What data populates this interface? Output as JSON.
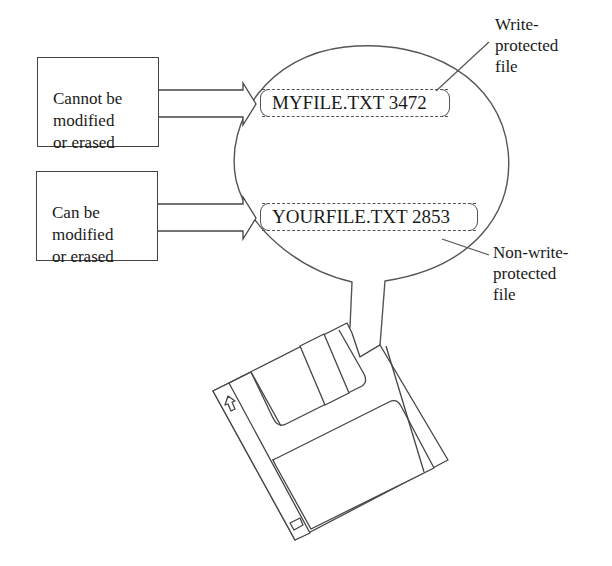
{
  "diagram": {
    "type": "floppy-disk-file-protection",
    "left_boxes": [
      {
        "id": "write-protected-box",
        "text": "Cannot be\nmodified\nor erased"
      },
      {
        "id": "non-write-protected-box",
        "text": "Can be\nmodified\nor erased"
      }
    ],
    "files": [
      {
        "name": "MYFILE.TXT",
        "size": "3472",
        "display": "MYFILE.TXT 3472",
        "protected": true
      },
      {
        "name": "YOURFILE.TXT",
        "size": "2853",
        "display": "YOURFILE.TXT 2853",
        "protected": false
      }
    ],
    "callouts": [
      {
        "text": "Write-\nprotected\nfile"
      },
      {
        "text": "Non-write-\nprotected\nfile"
      }
    ],
    "colors": {
      "line": "#444444",
      "background": "#ffffff",
      "text": "#1a1a1a"
    }
  }
}
